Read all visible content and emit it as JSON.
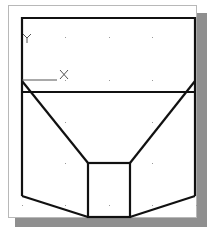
{
  "figure": {
    "colors": {
      "background": "#ffffff",
      "panel_border": "#b8b8b8",
      "shadow": "#8f8f8f",
      "outline": "#111111",
      "ucs": "#555555",
      "grid_dot": "#9a9a9a"
    },
    "ucs_icon": {
      "x_label": "X",
      "y_label": "Y"
    },
    "outline": {
      "stroke_width": 2.2,
      "top_rect": {
        "x1": 22,
        "y1": 18,
        "x2": 195,
        "y2": 18
      },
      "horizontal_band_y": 92,
      "left_edge_x": 22,
      "right_edge_x": 195,
      "bottom_corner_y": 196,
      "diagonal_start_y": 81,
      "inner_box": {
        "x": 88,
        "y": 163,
        "width": 42,
        "height": 54
      }
    },
    "grid": {
      "spacing_x": 44,
      "spacing_y": 42,
      "origin_x": 22,
      "origin_y": 38
    }
  }
}
